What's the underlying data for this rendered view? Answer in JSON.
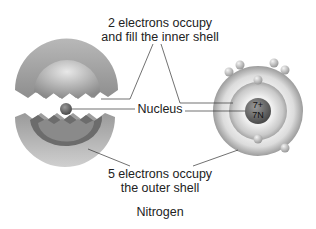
{
  "diagram": {
    "title": "Nitrogen",
    "labels": {
      "inner_line1": "2 electrons occupy",
      "inner_line2": "and fill the inner shell",
      "nucleus": "Nucleus",
      "outer_line1": "5 electrons occupy",
      "outer_line2": "the outer shell"
    },
    "nucleus_text": {
      "charge": "7+",
      "symbol": "7N"
    },
    "colors": {
      "shell_dark": "#8a8a8a",
      "shell_light": "#e6e6e6",
      "nucleus": "#6f6f6f",
      "line": "#333333"
    }
  }
}
